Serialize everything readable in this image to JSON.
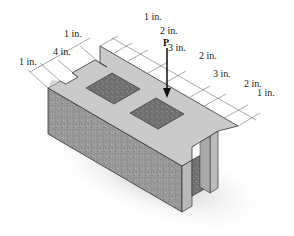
{
  "figure": {
    "type": "isometric concrete block with dimensions",
    "load_label": "P",
    "dimensions_left": [
      {
        "id": "d_left_1a",
        "text": "1 in."
      },
      {
        "id": "d_left_4",
        "text": "4 in."
      },
      {
        "id": "d_left_1b",
        "text": "1 in."
      }
    ],
    "dimensions_top": [
      {
        "id": "d_top_1",
        "text": "1 in."
      },
      {
        "id": "d_top_2a",
        "text": "2 in."
      },
      {
        "id": "d_top_3a",
        "text": "3 in."
      },
      {
        "id": "d_top_2b",
        "text": "2 in."
      },
      {
        "id": "d_top_3b",
        "text": "3 in."
      },
      {
        "id": "d_top_2c",
        "text": "2 in."
      },
      {
        "id": "d_top_1b",
        "text": "1 in."
      }
    ],
    "colors": {
      "top_face": "#c9c9c9",
      "front_face": "#9a9a9a",
      "end_face": "#b4b4b4",
      "hole": "#6e6e6e",
      "shadow": "#d6d6d6",
      "line": "#333333"
    }
  }
}
